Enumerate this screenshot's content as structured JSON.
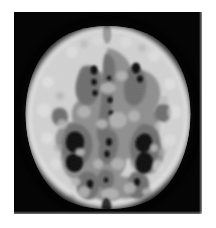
{
  "image": {
    "kind": "medical-brain-scan",
    "modality_label": "axial brain slice",
    "orientation": "axial",
    "frame": {
      "x": 14,
      "y": 12,
      "width": 188,
      "height": 202
    },
    "canvas": {
      "width": 216,
      "height": 228
    },
    "background_color": "#ffffff",
    "alt_text": "Axial brain slice with posterized grayscale tissue classes"
  },
  "palette": {
    "background": "#050505",
    "csf_dark": "#0d0d0d",
    "deep_gray": "#6e6e6e",
    "white_matter": "#8f8f8f",
    "cortex_mid": "#b4b4b4",
    "cortex_bright": "#d2d2d2",
    "cortex_peak": "#e2e2e2",
    "scalp_halo": "#3a3a3a"
  },
  "tissue_classes": [
    {
      "name": "background",
      "label": "Background",
      "color": "#050505",
      "level": 5
    },
    {
      "name": "csf",
      "label": "CSF / sulci",
      "color": "#101010",
      "level": 16
    },
    {
      "name": "deep-gray",
      "label": "Deep gray matter",
      "color": "#6e6e6e",
      "level": 110
    },
    {
      "name": "white-matter",
      "label": "White matter",
      "color": "#8f8f8f",
      "level": 143
    },
    {
      "name": "cortex",
      "label": "Cortical ribbon",
      "color": "#cfcfcf",
      "level": 207
    }
  ],
  "regions": [
    {
      "name": "frontal-lobe",
      "label": "Frontal lobe"
    },
    {
      "name": "interhemispheric-fissure",
      "label": "Interhemispheric fissure"
    },
    {
      "name": "left-ventricle",
      "label": "Left lateral ventricle"
    },
    {
      "name": "right-ventricle",
      "label": "Right lateral ventricle"
    },
    {
      "name": "occipital-lobe",
      "label": "Occipital lobe"
    },
    {
      "name": "temporal-left",
      "label": "Left temporal region"
    },
    {
      "name": "temporal-right",
      "label": "Right temporal region"
    }
  ],
  "chart_data": {
    "type": "heatmap",
    "title": "",
    "xlabel": "",
    "ylabel": "",
    "grid": false,
    "legend": "none",
    "colormap": "grayscale",
    "value_range": [
      0,
      255
    ],
    "note": "Posterized axial brain slice: five quantized intensity classes"
  }
}
